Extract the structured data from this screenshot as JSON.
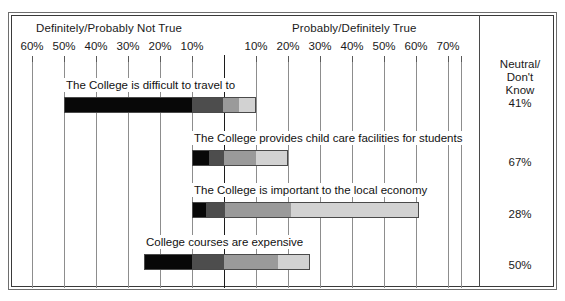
{
  "header": {
    "left_label": "Definitely/Probably Not True",
    "right_label": "Probably/Definitely True"
  },
  "neutral_column": {
    "title_line1": "Neutral/",
    "title_line2": "Don't",
    "title_line3": "Know"
  },
  "chart_data": {
    "type": "bar",
    "subtype": "diverging-stacked-bar",
    "title": "",
    "xlabel": "",
    "ylabel": "",
    "grid": true,
    "legend_position": "top",
    "axis": {
      "zero_at_percent": 0,
      "left_tick_labels": [
        "60%",
        "50%",
        "40%",
        "30%",
        "20%",
        "10%"
      ],
      "right_tick_labels": [
        "10%",
        "20%",
        "30%",
        "40%",
        "50%",
        "60%",
        "70%"
      ],
      "left_max_percent": 65,
      "right_max_percent": 74,
      "tick_step_percent": 10
    },
    "series": [
      {
        "name": "Definitely Not True",
        "color": "#080808"
      },
      {
        "name": "Probably Not True",
        "color": "#4d4d4d"
      },
      {
        "name": "Probably True",
        "color": "#9a9a9a"
      },
      {
        "name": "Definitely True",
        "color": "#d2d2d2"
      }
    ],
    "categories": [
      "The College is difficult to travel to",
      "The College provides child care facilities for students",
      "The College is important to the local economy",
      "College courses are expensive"
    ],
    "rows": [
      {
        "label": "The College is difficult to travel to",
        "neutral": "41%",
        "not_true_total": 50,
        "true_total": 10,
        "segments": [
          {
            "series": "Definitely Not True",
            "percent": 40
          },
          {
            "series": "Probably Not True",
            "percent": 10
          },
          {
            "series": "Probably True",
            "percent": 5
          },
          {
            "series": "Definitely True",
            "percent": 5
          }
        ]
      },
      {
        "label": "The College provides child care facilities for students",
        "neutral": "67%",
        "not_true_total": 10,
        "true_total": 20,
        "segments": [
          {
            "series": "Definitely Not True",
            "percent": 5
          },
          {
            "series": "Probably Not True",
            "percent": 5
          },
          {
            "series": "Probably True",
            "percent": 10
          },
          {
            "series": "Definitely True",
            "percent": 10
          }
        ]
      },
      {
        "label": "The College is important to the local economy",
        "neutral": "28%",
        "not_true_total": 10,
        "true_total": 61,
        "segments": [
          {
            "series": "Definitely Not True",
            "percent": 4
          },
          {
            "series": "Probably Not True",
            "percent": 6
          },
          {
            "series": "Probably True",
            "percent": 21
          },
          {
            "series": "Definitely True",
            "percent": 40
          }
        ]
      },
      {
        "label": "College courses are expensive",
        "neutral": "50%",
        "not_true_total": 25,
        "true_total": 27,
        "segments": [
          {
            "series": "Definitely Not True",
            "percent": 15
          },
          {
            "series": "Probably Not True",
            "percent": 10
          },
          {
            "series": "Probably True",
            "percent": 17
          },
          {
            "series": "Definitely True",
            "percent": 10
          }
        ]
      }
    ]
  }
}
